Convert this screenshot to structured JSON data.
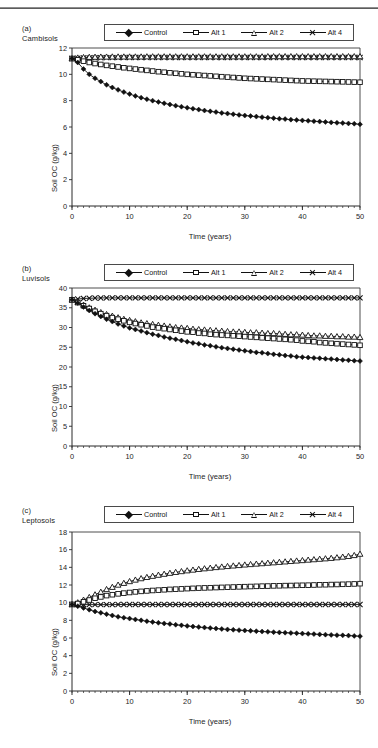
{
  "figure": {
    "top_rule": true,
    "axis_label_x": "Time (years)",
    "axis_label_y": "Soil OC (g/kg)"
  },
  "legend": {
    "items": [
      {
        "label": "Control",
        "marker": "filled-diamond-icon"
      },
      {
        "label": "Alt 1",
        "marker": "open-square-icon"
      },
      {
        "label": "Alt 2",
        "marker": "open-triangle-icon"
      },
      {
        "label": "Alt 4",
        "marker": "cross-x-icon"
      }
    ]
  },
  "panels": [
    {
      "tag": "(a)",
      "name": "Cambisols",
      "tag_text": "(a)\nCambisols"
    },
    {
      "tag": "(b)",
      "name": "Luvisols",
      "tag_text": "(b)\nLuvisols"
    },
    {
      "tag": "(c)",
      "name": "Leptosols",
      "tag_text": "(c)\nLeptosols"
    }
  ],
  "chart_data": [
    {
      "type": "line",
      "title": "(a) Cambisols",
      "xlabel": "Time (years)",
      "ylabel": "Soil OC (g/kg)",
      "xlim": [
        0,
        50
      ],
      "ylim": [
        0,
        12
      ],
      "xticks": [
        0,
        10,
        20,
        30,
        40,
        50
      ],
      "yticks": [
        0,
        2,
        4,
        6,
        8,
        10,
        12
      ],
      "x_minor_tick_step": 1,
      "grid": false,
      "legend_position": "top-center",
      "x": [
        0,
        1,
        2,
        3,
        4,
        5,
        6,
        7,
        8,
        9,
        10,
        11,
        12,
        13,
        14,
        15,
        16,
        17,
        18,
        19,
        20,
        21,
        22,
        23,
        24,
        25,
        26,
        27,
        28,
        29,
        30,
        31,
        32,
        33,
        34,
        35,
        36,
        37,
        38,
        39,
        40,
        41,
        42,
        43,
        44,
        45,
        46,
        47,
        48,
        49,
        50
      ],
      "series": [
        {
          "name": "Control",
          "marker": "filled-diamond-icon",
          "values": [
            11.2,
            10.9,
            10.4,
            10.0,
            9.7,
            9.45,
            9.2,
            9.0,
            8.82,
            8.65,
            8.5,
            8.36,
            8.23,
            8.11,
            8.0,
            7.9,
            7.8,
            7.71,
            7.62,
            7.54,
            7.46,
            7.39,
            7.32,
            7.25,
            7.19,
            7.13,
            7.07,
            7.02,
            6.97,
            6.92,
            6.87,
            6.83,
            6.79,
            6.75,
            6.71,
            6.67,
            6.63,
            6.6,
            6.56,
            6.53,
            6.5,
            6.47,
            6.44,
            6.41,
            6.38,
            6.35,
            6.32,
            6.3,
            6.27,
            6.25,
            6.2
          ]
        },
        {
          "name": "Alt 1",
          "marker": "open-square-icon",
          "values": [
            11.2,
            11.1,
            11.0,
            10.9,
            10.82,
            10.75,
            10.68,
            10.62,
            10.56,
            10.5,
            10.45,
            10.4,
            10.35,
            10.3,
            10.25,
            10.2,
            10.16,
            10.12,
            10.08,
            10.04,
            10.0,
            9.97,
            9.94,
            9.91,
            9.88,
            9.85,
            9.82,
            9.79,
            9.76,
            9.73,
            9.7,
            9.68,
            9.66,
            9.64,
            9.62,
            9.6,
            9.58,
            9.56,
            9.54,
            9.52,
            9.5,
            9.49,
            9.48,
            9.47,
            9.46,
            9.45,
            9.44,
            9.43,
            9.42,
            9.41,
            9.4
          ]
        },
        {
          "name": "Alt 2",
          "marker": "open-triangle-icon",
          "values": [
            11.2,
            11.25,
            11.28,
            11.3,
            11.31,
            11.32,
            11.32,
            11.33,
            11.33,
            11.33,
            11.33,
            11.33,
            11.33,
            11.34,
            11.34,
            11.34,
            11.34,
            11.34,
            11.34,
            11.34,
            11.34,
            11.34,
            11.34,
            11.34,
            11.34,
            11.34,
            11.34,
            11.34,
            11.34,
            11.34,
            11.34,
            11.34,
            11.34,
            11.34,
            11.35,
            11.35,
            11.35,
            11.35,
            11.35,
            11.35,
            11.35,
            11.35,
            11.35,
            11.35,
            11.35,
            11.35,
            11.35,
            11.35,
            11.35,
            11.35,
            11.35
          ]
        },
        {
          "name": "Alt 4",
          "marker": "cross-x-icon",
          "values": [
            11.2,
            11.22,
            11.24,
            11.25,
            11.26,
            11.26,
            11.27,
            11.27,
            11.27,
            11.28,
            11.28,
            11.28,
            11.28,
            11.28,
            11.28,
            11.28,
            11.28,
            11.28,
            11.28,
            11.28,
            11.28,
            11.28,
            11.28,
            11.28,
            11.28,
            11.28,
            11.28,
            11.28,
            11.28,
            11.28,
            11.28,
            11.28,
            11.28,
            11.28,
            11.28,
            11.28,
            11.28,
            11.28,
            11.28,
            11.28,
            11.28,
            11.28,
            11.28,
            11.28,
            11.28,
            11.28,
            11.28,
            11.28,
            11.28,
            11.28,
            11.28
          ]
        }
      ]
    },
    {
      "type": "line",
      "title": "(b) Luvisols",
      "xlabel": "Time (years)",
      "ylabel": "Soil OC (g/kg)",
      "xlim": [
        0,
        50
      ],
      "ylim": [
        0,
        40
      ],
      "xticks": [
        0,
        10,
        20,
        30,
        40,
        50
      ],
      "yticks": [
        0,
        5,
        10,
        15,
        20,
        25,
        30,
        35,
        40
      ],
      "x_minor_tick_step": 1,
      "grid": false,
      "legend_position": "top-center",
      "x": [
        0,
        1,
        2,
        3,
        4,
        5,
        6,
        7,
        8,
        9,
        10,
        11,
        12,
        13,
        14,
        15,
        16,
        17,
        18,
        19,
        20,
        21,
        22,
        23,
        24,
        25,
        26,
        27,
        28,
        29,
        30,
        31,
        32,
        33,
        34,
        35,
        36,
        37,
        38,
        39,
        40,
        41,
        42,
        43,
        44,
        45,
        46,
        47,
        48,
        49,
        50
      ],
      "series": [
        {
          "name": "Control",
          "marker": "filled-diamond-icon",
          "values": [
            37.0,
            36.2,
            35.2,
            34.3,
            33.5,
            32.8,
            32.1,
            31.5,
            30.9,
            30.4,
            29.9,
            29.5,
            29.1,
            28.7,
            28.3,
            28.0,
            27.6,
            27.3,
            27.0,
            26.7,
            26.4,
            26.1,
            25.9,
            25.6,
            25.4,
            25.1,
            24.9,
            24.7,
            24.5,
            24.3,
            24.1,
            23.9,
            23.7,
            23.6,
            23.4,
            23.2,
            23.1,
            22.9,
            22.8,
            22.6,
            22.5,
            22.4,
            22.3,
            22.2,
            22.1,
            22.0,
            21.9,
            21.8,
            21.7,
            21.6,
            21.5
          ]
        },
        {
          "name": "Alt 1",
          "marker": "open-square-icon",
          "values": [
            37.0,
            36.3,
            35.5,
            34.8,
            34.1,
            33.5,
            33.0,
            32.5,
            32.1,
            31.7,
            31.3,
            31.0,
            30.7,
            30.4,
            30.1,
            29.9,
            29.7,
            29.5,
            29.3,
            29.1,
            28.9,
            28.8,
            28.6,
            28.5,
            28.3,
            28.2,
            28.1,
            28.0,
            27.9,
            27.8,
            27.7,
            27.6,
            27.5,
            27.4,
            27.3,
            27.2,
            27.1,
            27.0,
            26.9,
            26.8,
            26.6,
            26.5,
            26.4,
            26.2,
            26.1,
            26.0,
            25.9,
            25.8,
            25.7,
            25.6,
            25.5
          ]
        },
        {
          "name": "Alt 2",
          "marker": "open-triangle-icon",
          "values": [
            37.0,
            36.4,
            35.7,
            35.0,
            34.4,
            33.8,
            33.3,
            32.9,
            32.5,
            32.1,
            31.8,
            31.5,
            31.2,
            31.0,
            30.8,
            30.6,
            30.4,
            30.2,
            30.0,
            29.9,
            29.8,
            29.6,
            29.5,
            29.4,
            29.3,
            29.2,
            29.1,
            29.0,
            28.9,
            28.9,
            28.8,
            28.7,
            28.7,
            28.6,
            28.5,
            28.5,
            28.4,
            28.3,
            28.2,
            28.2,
            28.1,
            28.0,
            27.9,
            27.9,
            27.8,
            27.8,
            27.7,
            27.7,
            27.6,
            27.6,
            27.5
          ]
        },
        {
          "name": "Alt 4",
          "marker": "cross-x-icon",
          "values": [
            37.0,
            37.2,
            37.35,
            37.4,
            37.45,
            37.48,
            37.5,
            37.5,
            37.5,
            37.5,
            37.5,
            37.5,
            37.5,
            37.5,
            37.5,
            37.5,
            37.5,
            37.5,
            37.5,
            37.5,
            37.5,
            37.5,
            37.5,
            37.5,
            37.5,
            37.5,
            37.5,
            37.5,
            37.5,
            37.5,
            37.5,
            37.5,
            37.5,
            37.5,
            37.5,
            37.5,
            37.5,
            37.5,
            37.5,
            37.5,
            37.5,
            37.5,
            37.5,
            37.5,
            37.5,
            37.5,
            37.5,
            37.5,
            37.5,
            37.5,
            37.5
          ]
        }
      ]
    },
    {
      "type": "line",
      "title": "(c) Leptosols",
      "xlabel": "Time (years)",
      "ylabel": "Soil OC (g/kg)",
      "xlim": [
        0,
        50
      ],
      "ylim": [
        0,
        18
      ],
      "xticks": [
        0,
        10,
        20,
        30,
        40,
        50
      ],
      "yticks": [
        0,
        2,
        4,
        6,
        8,
        10,
        12,
        14,
        16,
        18
      ],
      "x_minor_tick_step": 1,
      "grid": false,
      "legend_position": "top-center",
      "x": [
        0,
        1,
        2,
        3,
        4,
        5,
        6,
        7,
        8,
        9,
        10,
        11,
        12,
        13,
        14,
        15,
        16,
        17,
        18,
        19,
        20,
        21,
        22,
        23,
        24,
        25,
        26,
        27,
        28,
        29,
        30,
        31,
        32,
        33,
        34,
        35,
        36,
        37,
        38,
        39,
        40,
        41,
        42,
        43,
        44,
        45,
        46,
        47,
        48,
        49,
        50
      ],
      "series": [
        {
          "name": "Control",
          "marker": "filled-diamond-icon",
          "values": [
            9.8,
            9.6,
            9.4,
            9.2,
            9.0,
            8.85,
            8.7,
            8.55,
            8.4,
            8.3,
            8.2,
            8.1,
            8.0,
            7.9,
            7.8,
            7.72,
            7.65,
            7.58,
            7.5,
            7.43,
            7.37,
            7.3,
            7.24,
            7.18,
            7.12,
            7.07,
            7.02,
            6.97,
            6.93,
            6.89,
            6.85,
            6.81,
            6.77,
            6.73,
            6.7,
            6.66,
            6.63,
            6.6,
            6.57,
            6.54,
            6.5,
            6.47,
            6.44,
            6.41,
            6.38,
            6.35,
            6.32,
            6.3,
            6.27,
            6.24,
            6.2
          ]
        },
        {
          "name": "Alt 1",
          "marker": "open-square-icon",
          "values": [
            9.8,
            9.9,
            10.1,
            10.3,
            10.5,
            10.65,
            10.8,
            10.9,
            11.0,
            11.08,
            11.15,
            11.22,
            11.28,
            11.33,
            11.38,
            11.42,
            11.46,
            11.5,
            11.53,
            11.56,
            11.59,
            11.62,
            11.65,
            11.67,
            11.69,
            11.71,
            11.73,
            11.75,
            11.77,
            11.79,
            11.81,
            11.83,
            11.85,
            11.87,
            11.88,
            11.9,
            11.91,
            11.93,
            11.94,
            11.96,
            11.97,
            11.98,
            12.0,
            12.02,
            12.03,
            12.05,
            12.06,
            12.08,
            12.1,
            12.12,
            12.15
          ]
        },
        {
          "name": "Alt 2",
          "marker": "open-triangle-icon",
          "values": [
            9.8,
            10.0,
            10.3,
            10.6,
            10.9,
            11.2,
            11.5,
            11.75,
            12.0,
            12.2,
            12.4,
            12.57,
            12.73,
            12.87,
            13.0,
            13.12,
            13.23,
            13.34,
            13.44,
            13.53,
            13.62,
            13.7,
            13.78,
            13.85,
            13.92,
            13.99,
            14.05,
            14.11,
            14.17,
            14.22,
            14.28,
            14.33,
            14.38,
            14.43,
            14.48,
            14.53,
            14.58,
            14.63,
            14.68,
            14.73,
            14.78,
            14.83,
            14.88,
            14.93,
            14.98,
            15.03,
            15.1,
            15.17,
            15.25,
            15.35,
            15.5
          ]
        },
        {
          "name": "Alt 4",
          "marker": "cross-x-icon",
          "values": [
            9.8,
            9.78,
            9.78,
            9.78,
            9.78,
            9.78,
            9.78,
            9.78,
            9.79,
            9.79,
            9.79,
            9.79,
            9.79,
            9.79,
            9.79,
            9.79,
            9.79,
            9.79,
            9.79,
            9.79,
            9.79,
            9.79,
            9.79,
            9.79,
            9.79,
            9.79,
            9.8,
            9.8,
            9.8,
            9.8,
            9.8,
            9.8,
            9.8,
            9.8,
            9.8,
            9.8,
            9.8,
            9.8,
            9.8,
            9.8,
            9.8,
            9.8,
            9.8,
            9.8,
            9.8,
            9.8,
            9.8,
            9.8,
            9.8,
            9.8,
            9.8
          ]
        }
      ]
    }
  ]
}
